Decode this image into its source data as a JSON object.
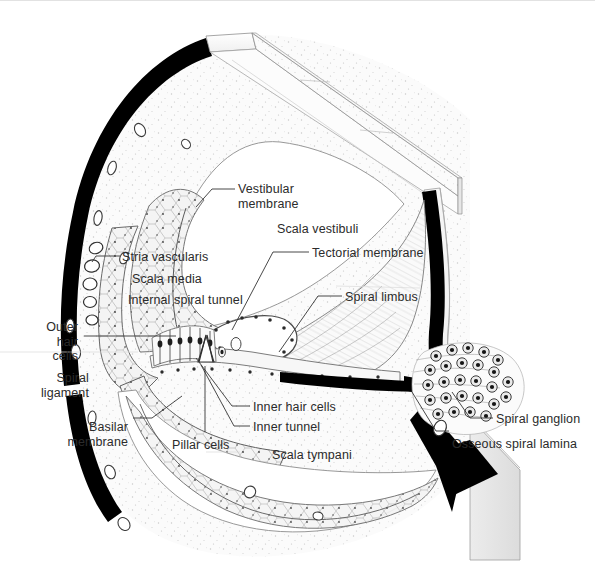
{
  "figure": {
    "width": 595,
    "height": 570,
    "background": "#ffffff",
    "ink_color": "#2b2b2b",
    "bone_color": "#000000",
    "tissue_fill": "#f2f2f2"
  },
  "labels": [
    {
      "id": "vestibular-membrane",
      "text": "Vestibular\nmembrane",
      "x": 238,
      "y": 182,
      "align": "left"
    },
    {
      "id": "scala-vestibuli",
      "text": "Scala vestibuli",
      "x": 277,
      "y": 222,
      "align": "left"
    },
    {
      "id": "tectorial-membrane",
      "text": "Tectorial membrane",
      "x": 312,
      "y": 246,
      "align": "left"
    },
    {
      "id": "spiral-limbus",
      "text": "Spiral limbus",
      "x": 345,
      "y": 290,
      "align": "left"
    },
    {
      "id": "stria-vascularis",
      "text": "Stria vascularis",
      "x": 122,
      "y": 250,
      "align": "left"
    },
    {
      "id": "scala-media",
      "text": "Scala media",
      "x": 132,
      "y": 272,
      "align": "left"
    },
    {
      "id": "internal-spiral-tunnel",
      "text": "Internal spiral tunnel",
      "x": 128,
      "y": 293,
      "align": "left"
    },
    {
      "id": "outer-hair-cells",
      "text": "Outer\nhair\ncells",
      "x": 22,
      "y": 320,
      "align": "right",
      "width": 56
    },
    {
      "id": "spiral-ligament",
      "text": "Spiral\nligament",
      "x": 27,
      "y": 371,
      "align": "right",
      "width": 62
    },
    {
      "id": "basilar-membrane",
      "text": "Basilar\nmembrane",
      "x": 50,
      "y": 420,
      "align": "right",
      "width": 78
    },
    {
      "id": "pillar-cells",
      "text": "Pillar cells",
      "x": 172,
      "y": 438,
      "align": "left"
    },
    {
      "id": "inner-hair-cells",
      "text": "Inner hair cells",
      "x": 253,
      "y": 400,
      "align": "left"
    },
    {
      "id": "inner-tunnel",
      "text": "Inner tunnel",
      "x": 253,
      "y": 420,
      "align": "left"
    },
    {
      "id": "scala-tympani",
      "text": "Scala tympani",
      "x": 272,
      "y": 448,
      "align": "left"
    },
    {
      "id": "spiral-ganglion",
      "text": "Spiral ganglion",
      "x": 496,
      "y": 412,
      "align": "left"
    },
    {
      "id": "osseous-spiral-lamina",
      "text": "Osseous spiral lamina",
      "x": 452,
      "y": 437,
      "align": "left"
    }
  ],
  "leaders": [
    {
      "id": "leader-vestibular-membrane",
      "points": "235,189 212,189 196,207"
    },
    {
      "id": "leader-tectorial-membrane",
      "points": "309,252 273,252 232,330"
    },
    {
      "id": "leader-spiral-limbus",
      "points": "342,296 318,296 279,352"
    },
    {
      "id": "leader-stria-vascularis",
      "points": "120,256 96,256 92,262"
    },
    {
      "id": "leader-outer-hair-cells",
      "points": "84,336 176,336"
    },
    {
      "id": "leader-inner-hair-cells",
      "points": "250,406 232,406 196,358"
    },
    {
      "id": "leader-inner-tunnel",
      "points": "250,426 234,426 201,365"
    },
    {
      "id": "leader-pillar-cells",
      "points": "205,432 205,366"
    },
    {
      "id": "leader-basilar-membrane",
      "points": "133,418 152,418 182,396"
    },
    {
      "id": "leader-spiral-ganglion",
      "points": "493,418 470,418 452,392"
    },
    {
      "id": "leader-osseous-spiral-lamina",
      "points": "449,431 436,431 412,392"
    }
  ],
  "structures": [
    {
      "id": "otic-capsule-bone",
      "kind": "bone-arc",
      "color": "#000000"
    },
    {
      "id": "scala-vestibuli-chamber",
      "kind": "chamber"
    },
    {
      "id": "scala-media-chamber",
      "kind": "chamber"
    },
    {
      "id": "scala-tympani-chamber",
      "kind": "chamber"
    },
    {
      "id": "modiolus-wall",
      "kind": "bone-wall"
    },
    {
      "id": "spiral-ganglion-cells",
      "kind": "cell-cluster",
      "count": 26
    },
    {
      "id": "organ-of-corti",
      "kind": "sensory-epithelium"
    },
    {
      "id": "reissners-membrane",
      "kind": "membrane"
    },
    {
      "id": "basilar-membrane-band",
      "kind": "membrane"
    }
  ]
}
